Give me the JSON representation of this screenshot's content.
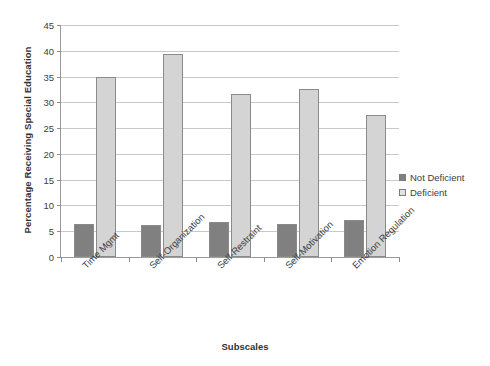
{
  "chart_data": {
    "type": "bar",
    "title": "",
    "xlabel": "Subscales",
    "ylabel": "Percentage Receiving Special Education",
    "categories": [
      "Time Mgmt",
      "Self-Organization",
      "Self-Restraint",
      "Self-Motivation",
      "Emotion Regulation"
    ],
    "series": [
      {
        "name": "Not Deficient",
        "color": "#808080",
        "values": [
          6.5,
          6.3,
          6.8,
          6.4,
          7.1
        ]
      },
      {
        "name": "Deficient",
        "color": "#d4d4d4",
        "values": [
          34.9,
          39.3,
          31.7,
          32.5,
          27.6
        ]
      }
    ],
    "ylim": [
      0,
      45
    ],
    "ytick_step": 5,
    "yticks": [
      "0",
      "5",
      "10",
      "15",
      "20",
      "25",
      "30",
      "35",
      "40",
      "45"
    ],
    "grid": "horizontal",
    "legend_position": "right"
  },
  "legend": {
    "items": [
      {
        "label": "Not Deficient"
      },
      {
        "label": "Deficient"
      }
    ]
  },
  "axes": {
    "x_title": "Subscales",
    "y_title": "Percentage Receiving Special Education"
  },
  "colors": {
    "not_deficient": "#808080",
    "deficient": "#d4d4d4",
    "gridline": "#c9c9c9",
    "axis": "#9b9b9b",
    "text": "#3a3a3a"
  }
}
